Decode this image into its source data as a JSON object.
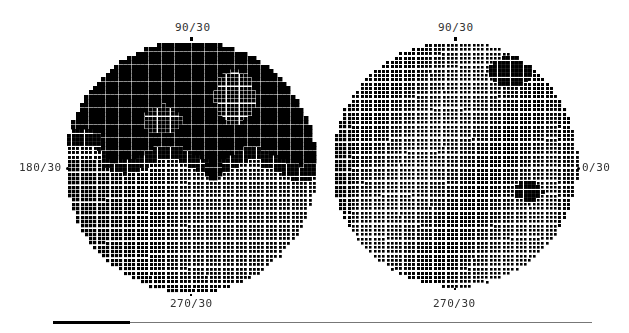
{
  "chart_data": [
    {
      "type": "heatmap",
      "title": "Visual field grayscale — left eye",
      "labels": {
        "top": "90/30",
        "left": "180/30",
        "bottom": "270/30"
      },
      "center": [
        191,
        167
      ],
      "radius": 126,
      "grid_step": 4.3,
      "description": "Dense dot grayscale; upper hemifield largely black (defect) with lighter islands near 105-120 deg; lower hemifield lighter dotted.",
      "regions": [
        {
          "shape": "upper_half",
          "cx": 0,
          "cy": -0.55,
          "rx": 1.2,
          "ry": 0.6,
          "darkness": 0.95
        },
        {
          "shape": "island",
          "cx": 0.35,
          "cy": -0.55,
          "rx": 0.16,
          "ry": 0.22,
          "darkness": 0.6
        },
        {
          "shape": "island",
          "cx": -0.22,
          "cy": -0.37,
          "rx": 0.15,
          "ry": 0.12,
          "darkness": 0.65
        },
        {
          "shape": "notch",
          "cx": 0.18,
          "cy": 0.02,
          "rx": 0.06,
          "ry": 0.1,
          "darkness": 0.95
        },
        {
          "shape": "notch",
          "cx": -0.6,
          "cy": -0.12,
          "rx": 0.08,
          "ry": 0.08,
          "darkness": 0.9
        }
      ]
    },
    {
      "type": "heatmap",
      "title": "Visual field grayscale — right eye",
      "labels": {
        "top": "90/30",
        "right": "0/30",
        "bottom": "270/30"
      },
      "center": [
        455,
        167
      ],
      "radius": 123,
      "grid_step": 4.3,
      "description": "Mostly uniform light dotted field; small darker patches at superior-temporal rim and near nasal inferior paracentral area.",
      "regions": [
        {
          "shape": "patch",
          "cx": 0.45,
          "cy": -0.75,
          "rx": 0.18,
          "ry": 0.12,
          "darkness": 0.75
        },
        {
          "shape": "patch",
          "cx": 0.6,
          "cy": 0.22,
          "rx": 0.12,
          "ry": 0.08,
          "darkness": 0.75
        }
      ]
    }
  ],
  "fields": {
    "left": {
      "label_top": "90/30",
      "label_left": "180/30",
      "label_bottom": "270/30"
    },
    "right": {
      "label_top": "90/30",
      "label_right": "0/30",
      "label_bottom": "270/30"
    }
  },
  "progress": {
    "percent": 14
  }
}
